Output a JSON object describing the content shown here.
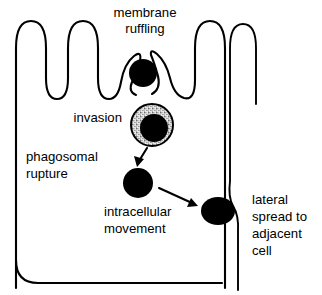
{
  "figure": {
    "type": "biological-process-diagram",
    "background_color": "#ffffff",
    "line_color": "#000000",
    "bacterium_color": "#000000",
    "phagosome_fill": "#d9d9d9"
  },
  "labels": {
    "membrane_ruffling_line1": "membrane",
    "membrane_ruffling_line2": "ruffling",
    "invasion": "invasion",
    "phagosomal_rupture_line1": "phagosomal",
    "phagosomal_rupture_line2": "rupture",
    "intracellular_movement_line1": "intracellular",
    "intracellular_movement_line2": "movement",
    "lateral_spread_line1": "lateral",
    "lateral_spread_line2": "spread to",
    "lateral_spread_line3": "adjacent",
    "lateral_spread_line4": "cell"
  },
  "stages": [
    {
      "order": 1,
      "name": "membrane ruffling"
    },
    {
      "order": 2,
      "name": "invasion"
    },
    {
      "order": 3,
      "name": "phagosomal rupture"
    },
    {
      "order": 4,
      "name": "intracellular movement"
    },
    {
      "order": 5,
      "name": "lateral spread to adjacent cell"
    }
  ]
}
